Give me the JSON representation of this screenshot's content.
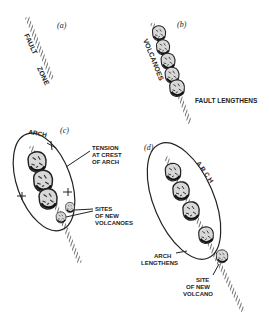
{
  "panels": [
    {
      "id": "a",
      "label": "(a)",
      "texts": {
        "fault": "FAULT",
        "zone": "ZONE"
      }
    },
    {
      "id": "b",
      "label": "(b)",
      "texts": {
        "volcanoes": "VOLCANOES",
        "fault_lengthens": "FAULT LENGTHENS"
      }
    },
    {
      "id": "c",
      "label": "(c)",
      "texts": {
        "arch": "ARCH",
        "tension_1": "TENSION",
        "tension_2": "AT CREST",
        "tension_3": "OF ARCH",
        "sites_1": "SITES",
        "sites_2": "OF NEW",
        "sites_3": "VOLCANOES"
      }
    },
    {
      "id": "d",
      "label": "(d)",
      "texts": {
        "arch": "ARCH",
        "arch_lengthens_1": "ARCH",
        "arch_lengthens_2": "LENGTHENS",
        "site_1": "SITE",
        "site_2": "OF NEW",
        "site_3": "VOLCANO"
      }
    }
  ],
  "colors": {
    "ink": "#222222",
    "background": "#ffffff"
  }
}
